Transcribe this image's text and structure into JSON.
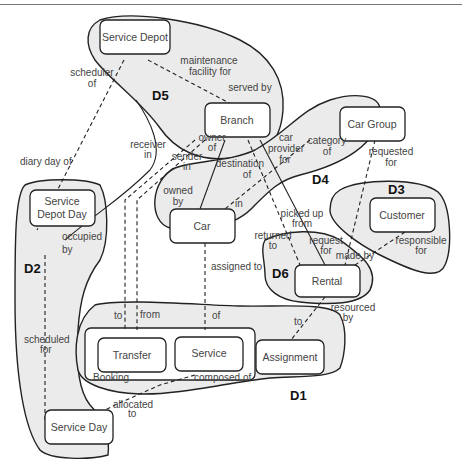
{
  "diagram": {
    "type": "entity-relationship with domain groupings",
    "domains": [
      {
        "id": "D1",
        "label": "D1"
      },
      {
        "id": "D2",
        "label": "D2"
      },
      {
        "id": "D3",
        "label": "D3"
      },
      {
        "id": "D4",
        "label": "D4"
      },
      {
        "id": "D5",
        "label": "D5"
      },
      {
        "id": "D6",
        "label": "D6"
      }
    ],
    "entities": {
      "service_depot": "Service Depot",
      "branch": "Branch",
      "car_group": "Car Group",
      "customer": "Customer",
      "service_depot_day": "Service Depot Day",
      "service_depot_day_l1": "Service",
      "service_depot_day_l2": "Depot Day",
      "car": "Car",
      "rental": "Rental",
      "transfer": "Transfer",
      "service": "Service",
      "assignment": "Assignment",
      "service_day": "Service Day",
      "booking": "Booking"
    },
    "relationships": {
      "scheduler_of_1": "scheduler",
      "scheduler_of_2": "of",
      "maintenance_1": "maintenance",
      "maintenance_2": "facility  for",
      "served_by": "served by",
      "diary_day_of": "diary day of",
      "receiver_in_1": "receiver",
      "receiver_in_2": "in",
      "sender_in_1": "sender",
      "sender_in_2": "in",
      "owner_of_1": "owner",
      "owner_of_2": "of",
      "destination_of_1": "destination",
      "destination_of_2": "of",
      "car_provider_1": "car",
      "car_provider_2": "provider",
      "car_provider_3": "for",
      "category_of_1": "category",
      "category_of_2": "of",
      "requested_for_1": "requested",
      "requested_for_2": "for",
      "owned_by_1": "owned",
      "owned_by_2": "by",
      "in": "in",
      "occupied_by_1": "occupied",
      "occupied_by_2": "by",
      "picked_up_1": "picked up",
      "picked_up_2": "from",
      "returned_to_1": "returned",
      "returned_to_2": "to",
      "request_for_1": "request",
      "request_for_2": "for",
      "responsible_1": "responsible",
      "responsible_2": "for",
      "made_by": "made by",
      "assigned_to": "assigned to",
      "resourced_by_1": "resourced",
      "resourced_by_2": "by",
      "to_transfer": "to",
      "from_transfer": "from",
      "of_service": "of",
      "to_assignment": "to",
      "scheduled_for_1": "scheduled",
      "scheduled_for_2": "for",
      "composed_of": "composed  of",
      "allocated_to_1": "allocated",
      "allocated_to_2": "to"
    }
  }
}
